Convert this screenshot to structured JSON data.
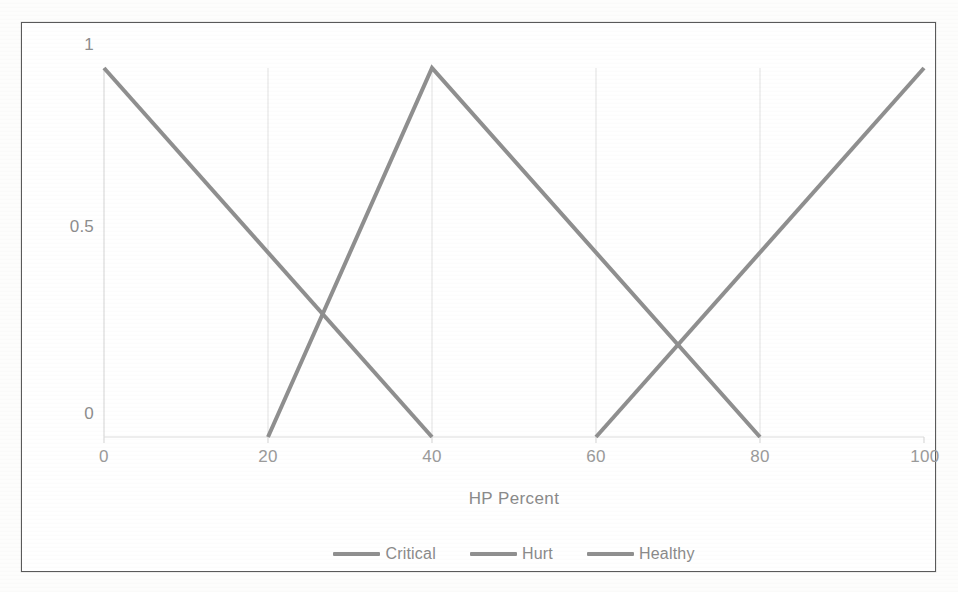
{
  "chart_data": {
    "type": "line",
    "title": "",
    "subtitle": "",
    "xlabel": "HP Percent",
    "ylabel": "",
    "xlim": [
      0,
      100
    ],
    "ylim": [
      0,
      1
    ],
    "xticks": [
      0,
      20,
      40,
      60,
      80,
      100
    ],
    "xtick_labels": [
      "0",
      "20",
      "40",
      "60",
      "80",
      "100"
    ],
    "yticks": [
      0,
      0.5,
      1
    ],
    "ytick_labels": [
      "0",
      "0.5",
      "1"
    ],
    "grid": "vertical-only",
    "legend_position": "bottom-center",
    "series": [
      {
        "name": "Critical",
        "color": "#8f8f8f",
        "points": [
          [
            0,
            1
          ],
          [
            40,
            0
          ]
        ]
      },
      {
        "name": "Hurt",
        "color": "#8f8f8f",
        "points": [
          [
            20,
            0
          ],
          [
            40,
            1
          ],
          [
            80,
            0
          ]
        ]
      },
      {
        "name": "Healthy",
        "color": "#8f8f8f",
        "points": [
          [
            60,
            0
          ],
          [
            100,
            1
          ]
        ]
      }
    ]
  },
  "axes": {
    "x_title": "HP Percent",
    "x_tick_labels": [
      "0",
      "20",
      "40",
      "60",
      "80",
      "100"
    ],
    "y_tick_labels": [
      "1",
      "0.5",
      "0"
    ]
  },
  "legend": {
    "items": [
      {
        "label": "Critical",
        "color": "#8f8f8f"
      },
      {
        "label": "Hurt",
        "color": "#8f8f8f"
      },
      {
        "label": "Healthy",
        "color": "#8f8f8f"
      }
    ]
  },
  "style": {
    "line_color": "#8f8f8f",
    "gridline_color": "#e2e2e2",
    "axis_color": "#d6d6d6",
    "text_color": "#8d8d8d",
    "frame_color": "#5a5a5a",
    "background": "#ffffff"
  }
}
